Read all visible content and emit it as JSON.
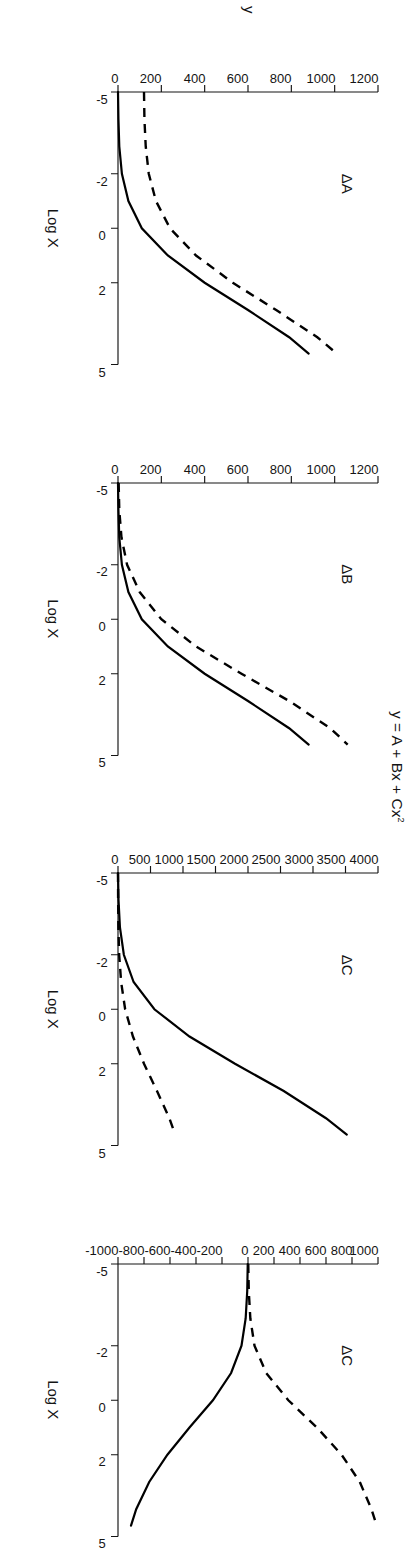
{
  "figure": {
    "title": "y = A + Bx + Cx",
    "title_superscript": "2",
    "y_axis_label": "y",
    "x_axis_label": "Log X",
    "x_ticks": [
      "-5",
      "-2",
      "0",
      "2",
      "5"
    ],
    "x_tick_values": [
      -5,
      -2,
      0,
      2,
      5
    ],
    "x_range": [
      -5,
      5
    ],
    "orientation": "rotated-90-clockwise"
  },
  "panels": [
    {
      "id": "panel-delta-a",
      "title": "ΔA",
      "y_ticks": [
        "0",
        "200",
        "400",
        "600",
        "800",
        "1000",
        "1200"
      ],
      "y_tick_values": [
        0,
        200,
        400,
        600,
        800,
        1000,
        1200
      ],
      "y_range": [
        0,
        1200
      ],
      "x_axis_label": "Log X",
      "show_y_axis_label": true
    },
    {
      "id": "panel-delta-b",
      "title": "ΔB",
      "y_ticks": [
        "0",
        "200",
        "400",
        "600",
        "800",
        "1000",
        "1200"
      ],
      "y_tick_values": [
        0,
        200,
        400,
        600,
        800,
        1000,
        1200
      ],
      "y_range": [
        0,
        1200
      ],
      "x_axis_label": "Log X",
      "show_y_axis_label": false
    },
    {
      "id": "panel-delta-c-1",
      "title": "ΔC",
      "y_ticks": [
        "0",
        "500",
        "1000",
        "1500",
        "2000",
        "2500",
        "3000",
        "3500",
        "4000"
      ],
      "y_tick_values": [
        0,
        500,
        1000,
        1500,
        2000,
        2500,
        3000,
        3500,
        4000
      ],
      "y_range": [
        0,
        4000
      ],
      "x_axis_label": "Log X",
      "show_y_axis_label": false
    },
    {
      "id": "panel-delta-c-2",
      "title": "ΔC",
      "y_ticks": [
        "-1000",
        "-800",
        "-600",
        "-400",
        "-200",
        "0",
        "200",
        "400",
        "600",
        "800",
        "1000"
      ],
      "y_tick_values": [
        -1000,
        -800,
        -600,
        -400,
        -200,
        0,
        200,
        400,
        600,
        800,
        1000
      ],
      "y_range": [
        -1000,
        1000
      ],
      "x_axis_label": "Log X",
      "show_y_axis_label": false
    }
  ],
  "chart_data": {
    "type": "line",
    "xlabel": "Log X",
    "ylabel": "y",
    "grid": false,
    "legend_position": "none",
    "panels": [
      {
        "name": "ΔA",
        "xlim": [
          -5,
          5
        ],
        "ylim": [
          0,
          1200
        ],
        "x": [
          -5,
          -4,
          -3,
          -2,
          -1,
          0,
          1,
          2,
          3,
          4,
          4.6
        ],
        "series": [
          {
            "name": "baseline",
            "style": "solid",
            "values": [
              0,
              2,
              6,
              18,
              48,
              110,
              230,
              400,
              600,
              790,
              880
            ]
          },
          {
            "name": "shifted-A",
            "style": "dashed",
            "values": [
              120,
              122,
              128,
              142,
              175,
              240,
              360,
              530,
              730,
              920,
              1010
            ]
          }
        ]
      },
      {
        "name": "ΔB",
        "xlim": [
          -5,
          5
        ],
        "ylim": [
          0,
          1200
        ],
        "x": [
          -5,
          -4,
          -3,
          -2,
          -1,
          0,
          1,
          2,
          3,
          4,
          4.6
        ],
        "series": [
          {
            "name": "baseline",
            "style": "solid",
            "values": [
              0,
              2,
              6,
              18,
              48,
              110,
              230,
              400,
              600,
              790,
              880
            ]
          },
          {
            "name": "shifted-B",
            "style": "dashed",
            "values": [
              3,
              6,
              16,
              42,
              100,
              200,
              360,
              570,
              790,
              980,
              1060
            ]
          }
        ]
      },
      {
        "name": "ΔC",
        "xlim": [
          -5,
          5
        ],
        "ylim": [
          0,
          4000
        ],
        "x": [
          -5,
          -4,
          -3,
          -2,
          -1,
          0,
          1,
          2,
          3,
          4,
          4.6
        ],
        "series": [
          {
            "name": "shifted-C",
            "style": "solid",
            "values": [
              0,
              8,
              30,
              90,
              240,
              560,
              1100,
              1800,
              2550,
              3200,
              3520
            ]
          },
          {
            "name": "baseline",
            "style": "dashed",
            "values": [
              0,
              2,
              6,
              18,
              48,
              110,
              230,
              400,
              600,
              790,
              880
            ]
          }
        ]
      },
      {
        "name": "ΔC",
        "xlim": [
          -5,
          5
        ],
        "ylim": [
          -1000,
          1000
        ],
        "x": [
          -5,
          -4,
          -3,
          -2,
          -1,
          0,
          1,
          2,
          3,
          4,
          4.6
        ],
        "series": [
          {
            "name": "difference-negative",
            "style": "solid",
            "values": [
              -2,
              -6,
              -18,
              -50,
              -130,
              -270,
              -450,
              -620,
              -760,
              -860,
              -900
            ]
          },
          {
            "name": "difference-positive",
            "style": "dashed",
            "values": [
              2,
              6,
              18,
              50,
              140,
              310,
              530,
              720,
              860,
              950,
              990
            ]
          }
        ]
      }
    ]
  }
}
